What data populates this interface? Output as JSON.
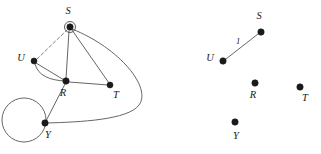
{
  "figure": {
    "background_color": "#ffffff",
    "edge_color": "#4a4a4a",
    "vertex_color": "#1a1a1a",
    "dashed_edge_color": "#707070",
    "width": 321,
    "height": 154
  },
  "panels": [
    {
      "id": "left-graph",
      "name": "original-multigraph",
      "vertices": [
        {
          "id": "S",
          "label": "S",
          "x": 70,
          "y": 27,
          "r": 3.2,
          "label_x": 68,
          "label_y": 12,
          "has_ring": true
        },
        {
          "id": "U",
          "label": "U",
          "x": 34,
          "y": 61,
          "r": 3.0,
          "label_x": 21,
          "label_y": 59,
          "has_ring": false
        },
        {
          "id": "R",
          "label": "R",
          "x": 66,
          "y": 81,
          "r": 3.2,
          "label_x": 63,
          "label_y": 94,
          "has_ring": false
        },
        {
          "id": "T",
          "label": "T",
          "x": 110,
          "y": 85,
          "r": 3.0,
          "label_x": 116,
          "label_y": 96,
          "has_ring": false
        },
        {
          "id": "Y",
          "label": "Y",
          "x": 45,
          "y": 123,
          "r": 3.2,
          "label_x": 48,
          "label_y": 136,
          "has_ring": false
        }
      ],
      "edges": [
        {
          "from": "U",
          "to": "S",
          "style": "dashed",
          "shape": "straight",
          "label": ""
        },
        {
          "from": "S",
          "to": "R",
          "style": "solid",
          "shape": "straight",
          "label": ""
        },
        {
          "from": "S",
          "to": "T",
          "style": "solid",
          "shape": "straight",
          "label": ""
        },
        {
          "from": "S",
          "to": "Y",
          "style": "solid",
          "shape": "curve-right",
          "label": ""
        },
        {
          "from": "U",
          "to": "R",
          "style": "solid",
          "shape": "straight",
          "label": ""
        },
        {
          "from": "U",
          "to": "R",
          "style": "solid",
          "shape": "curve-below",
          "label": ""
        },
        {
          "from": "R",
          "to": "T",
          "style": "solid",
          "shape": "straight",
          "label": ""
        },
        {
          "from": "R",
          "to": "Y",
          "style": "solid",
          "shape": "straight",
          "label": ""
        }
      ],
      "loops": [
        {
          "at": "S",
          "radius": 5.5,
          "cx": 70,
          "cy": 27
        },
        {
          "at": "Y",
          "radius": 22.0,
          "cx": 24,
          "cy": 120
        }
      ]
    },
    {
      "id": "right-graph",
      "name": "spanning-subgraph",
      "vertices": [
        {
          "id": "S",
          "label": "S",
          "x": 261,
          "y": 32,
          "r": 3.2,
          "label_x": 259,
          "label_y": 17,
          "has_ring": false
        },
        {
          "id": "U",
          "label": "U",
          "x": 223,
          "y": 61,
          "r": 3.2,
          "label_x": 210,
          "label_y": 59,
          "has_ring": false
        },
        {
          "id": "R",
          "label": "R",
          "x": 255,
          "y": 83,
          "r": 3.2,
          "label_x": 253,
          "label_y": 96,
          "has_ring": false
        },
        {
          "id": "T",
          "label": "T",
          "x": 300,
          "y": 87,
          "r": 3.2,
          "label_x": 305,
          "label_y": 99,
          "has_ring": false
        },
        {
          "id": "Y",
          "label": "Y",
          "x": 235,
          "y": 122,
          "r": 3.2,
          "label_x": 236,
          "label_y": 137,
          "has_ring": false
        }
      ],
      "edges": [
        {
          "from": "U",
          "to": "S",
          "style": "solid",
          "shape": "straight",
          "label": "1",
          "label_x": 238,
          "label_y": 42
        }
      ],
      "loops": []
    }
  ],
  "labels": {
    "left_S": "S",
    "left_U": "U",
    "left_R": "R",
    "left_T": "T",
    "left_Y": "Y",
    "right_S": "S",
    "right_U": "U",
    "right_R": "R",
    "right_T": "T",
    "right_Y": "Y",
    "edge_weight_1": "1"
  }
}
